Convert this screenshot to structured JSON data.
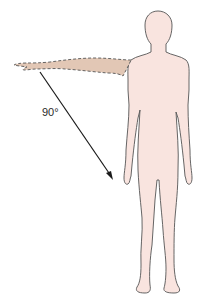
{
  "figure": {
    "angle_label": "90°",
    "colors": {
      "body_fill": "#f9e4df",
      "body_stroke": "#555555",
      "arm_fill": "#e2c7b5",
      "arm_stroke": "#555555",
      "arrow": "#1a1a1a",
      "background": "#ffffff"
    }
  }
}
